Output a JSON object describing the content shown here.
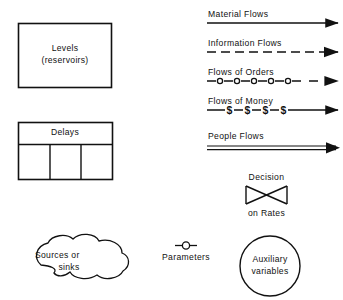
{
  "diagram": {
    "background_color": "#ffffff",
    "stroke_color": "#111111"
  },
  "shapes": {
    "levels": {
      "label_line1": "Levels",
      "label_line2": "(reservoirs)",
      "shape": "rectangle"
    },
    "delays": {
      "label": "Delays",
      "shape": "rectangle-with-three-cells",
      "cell_count": 3
    },
    "sources_sinks": {
      "label_line1": "Sources or",
      "label_line2": "sinks",
      "shape": "cloud-blob"
    },
    "parameters": {
      "label": "Parameters",
      "shape": "circle-on-line"
    },
    "auxiliary": {
      "label_line1": "Auxiliary",
      "label_line2": "variables",
      "shape": "circle"
    },
    "decision": {
      "label_above": "Decision",
      "label_below": "on Rates",
      "shape": "valve-bowtie"
    }
  },
  "flows": [
    {
      "label": "Material Flows",
      "style": "solid-arrow"
    },
    {
      "label": "Information Flows",
      "style": "dashed-arrow"
    },
    {
      "label": "Flows of Orders",
      "style": "circle-marked-arrow",
      "marker": "o"
    },
    {
      "label": "Flows of Money",
      "style": "dollar-marked-arrow",
      "marker": "$"
    },
    {
      "label": "People Flows",
      "style": "double-line-arrow"
    }
  ]
}
